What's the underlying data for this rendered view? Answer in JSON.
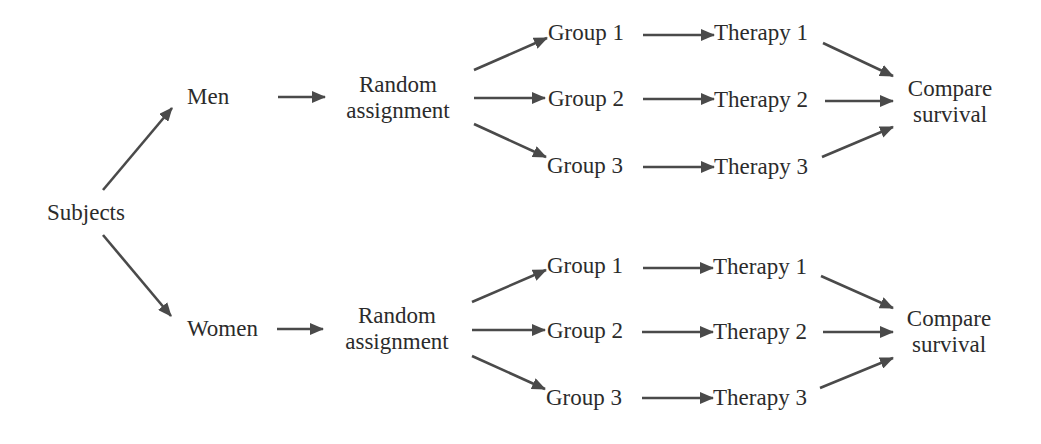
{
  "diagram": {
    "root": "Subjects",
    "arrow_color": "#4a4a4a",
    "text_color": "#2b2b2b",
    "branches": [
      {
        "stratum": "Men",
        "randomization": {
          "line1": "Random",
          "line2": "assignment"
        },
        "groups": [
          {
            "group": "Group 1",
            "therapy": "Therapy 1"
          },
          {
            "group": "Group 2",
            "therapy": "Therapy 2"
          },
          {
            "group": "Group 3",
            "therapy": "Therapy 3"
          }
        ],
        "outcome": {
          "line1": "Compare",
          "line2": "survival"
        }
      },
      {
        "stratum": "Women",
        "randomization": {
          "line1": "Random",
          "line2": "assignment"
        },
        "groups": [
          {
            "group": "Group 1",
            "therapy": "Therapy 1"
          },
          {
            "group": "Group 2",
            "therapy": "Therapy 2"
          },
          {
            "group": "Group 3",
            "therapy": "Therapy 3"
          }
        ],
        "outcome": {
          "line1": "Compare",
          "line2": "survival"
        }
      }
    ]
  }
}
